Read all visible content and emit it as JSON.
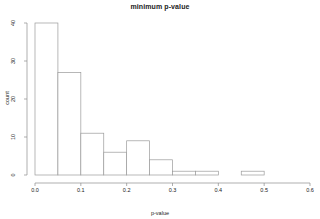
{
  "chart_data": {
    "type": "bar",
    "title": "minimum p-value",
    "xlabel": "p-value",
    "ylabel": "count",
    "grid": false,
    "legend": null,
    "xlim": [
      0.0,
      0.6
    ],
    "ylim": [
      0,
      40
    ],
    "bin_width": 0.05,
    "xticks": [
      "0.0",
      "0.1",
      "0.2",
      "0.3",
      "0.4",
      "0.5",
      "0.6"
    ],
    "xtick_values": [
      0.0,
      0.1,
      0.2,
      0.3,
      0.4,
      0.5,
      0.6
    ],
    "yticks": [
      "0",
      "10",
      "20",
      "30",
      "40"
    ],
    "ytick_values": [
      0,
      10,
      20,
      30,
      40
    ],
    "categories": [
      "0.00-0.05",
      "0.05-0.10",
      "0.10-0.15",
      "0.15-0.20",
      "0.20-0.25",
      "0.25-0.30",
      "0.30-0.35",
      "0.35-0.40",
      "0.40-0.45",
      "0.45-0.50"
    ],
    "bin_starts": [
      0.0,
      0.05,
      0.1,
      0.15,
      0.2,
      0.25,
      0.3,
      0.35,
      0.4,
      0.45
    ],
    "bin_ends": [
      0.05,
      0.1,
      0.15,
      0.2,
      0.25,
      0.3,
      0.35,
      0.4,
      0.45,
      0.5
    ],
    "values": [
      40,
      27,
      11,
      6,
      9,
      4,
      1,
      1,
      0,
      1
    ],
    "bar_fill": "#ffffff",
    "bar_stroke": "#9a9a9a",
    "axis_color": "#8d8d8d",
    "text_color": "#1a1a1a"
  }
}
